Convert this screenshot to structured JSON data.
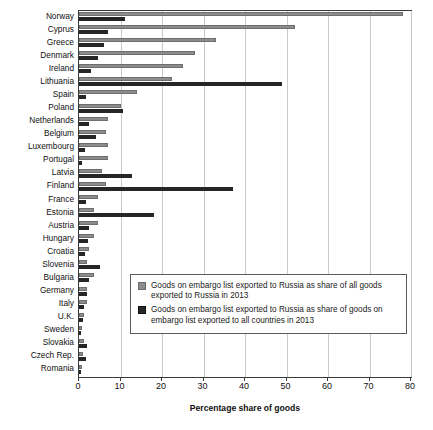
{
  "chart_data": {
    "type": "bar",
    "orientation": "horizontal",
    "title": "",
    "xlabel": "Percentage share of goods",
    "ylabel": "",
    "xlim": [
      0,
      80
    ],
    "xticks": [
      0,
      10,
      20,
      30,
      40,
      50,
      60,
      70,
      80
    ],
    "grid": "vertical",
    "legend_position": "inside-lower-right",
    "categories": [
      "Norway",
      "Cyprus",
      "Greece",
      "Denmark",
      "Ireland",
      "Lithuania",
      "Spain",
      "Poland",
      "Netherlands",
      "Belgium",
      "Luxembourg",
      "Portugal",
      "Latvia",
      "Finland",
      "France",
      "Estonia",
      "Austria",
      "Hungary",
      "Croatia",
      "Slovenia",
      "Bulgaria",
      "Germany",
      "Italy",
      "U.K.",
      "Sweden",
      "Slovakia",
      "Czech Rep.",
      "Romania"
    ],
    "series": [
      {
        "name": "Goods on embargo list exported to Russia as share of all goods exported to Russia in 2013",
        "color": "#8d8d8d",
        "values": [
          78.0,
          52.0,
          33.0,
          28.0,
          25.0,
          22.5,
          14.0,
          10.0,
          7.0,
          6.5,
          7.0,
          7.0,
          5.5,
          6.5,
          4.5,
          3.5,
          4.5,
          3.5,
          2.5,
          2.0,
          3.5,
          2.0,
          2.0,
          1.2,
          0.8,
          1.2,
          1.0,
          0.8
        ]
      },
      {
        "name": "Goods on embargo list exported to Russia as share of goods on embargo list exported to all countries in 2013",
        "color": "#262626",
        "values": [
          11.0,
          7.0,
          6.0,
          4.5,
          3.0,
          49.0,
          1.7,
          10.5,
          2.5,
          4.0,
          1.5,
          0.7,
          12.7,
          37.0,
          1.7,
          18.0,
          2.5,
          2.2,
          1.5,
          5.0,
          2.5,
          2.0,
          1.2,
          1.0,
          0.6,
          2.0,
          1.6,
          0.6
        ]
      }
    ],
    "legend": [
      {
        "swatch": "light-gray",
        "color": "#8d8d8d",
        "label": "Goods on embargo list exported to Russia as share of all goods exported to Russia in 2013"
      },
      {
        "swatch": "dark-gray",
        "color": "#262626",
        "label": "Goods on embargo list exported to Russia as share of goods on embargo list exported to all countries in 2013"
      }
    ]
  }
}
